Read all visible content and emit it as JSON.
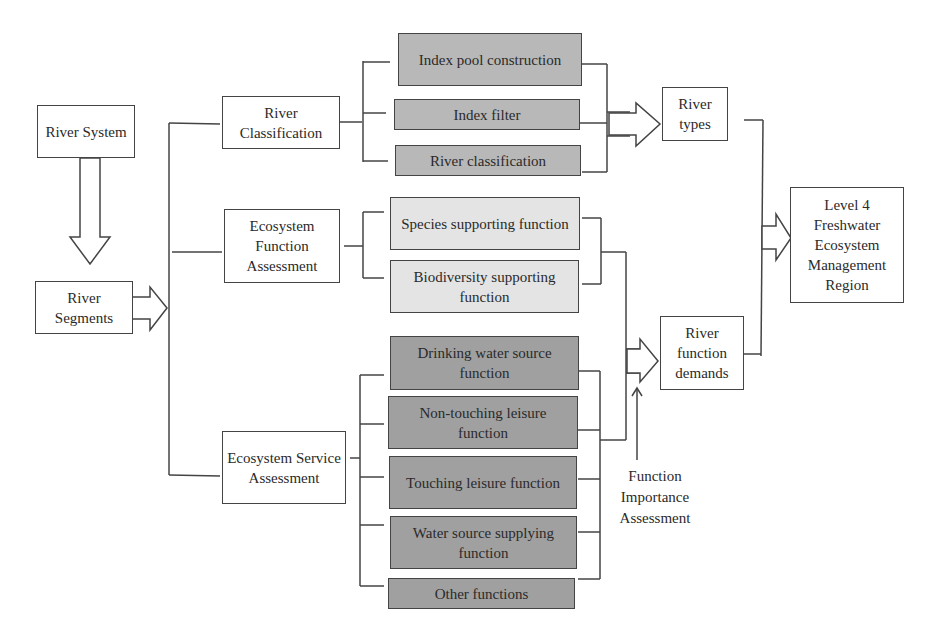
{
  "diagram": {
    "title": "",
    "left": {
      "river_system": "River System",
      "river_segments": "River Segments"
    },
    "middle": {
      "river_classification": "River Classification",
      "ecosystem_function_assessment": "Ecosystem Function Assessment",
      "ecosystem_service_assessment": "Ecosystem Service Assessment"
    },
    "classification_steps": [
      "Index pool construction",
      "Index filter",
      "River classification"
    ],
    "function_items": [
      "Species supporting function",
      "Biodiversity supporting function"
    ],
    "service_items": [
      "Drinking water source function",
      "Non-touching leisure function",
      "Touching leisure function",
      "Water source supplying function",
      "Other functions"
    ],
    "outputs": {
      "river_types": "River types",
      "river_function_demands": "River function demands",
      "function_importance_assessment": "Function Importance Assessment"
    },
    "final": "Level 4 Freshwater Ecosystem Management Region",
    "colors": {
      "classification_fill": "#b8b8b8",
      "function_fill": "#e4e4e4",
      "service_fill": "#a0a0a0",
      "line": "#444444"
    }
  }
}
